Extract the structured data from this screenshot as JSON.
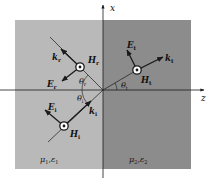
{
  "diagram": {
    "colors": {
      "background": "#ffffff",
      "medium1": "#b9b9b9",
      "medium2": "#8c8c8c",
      "lines": "#1a1a1a",
      "marker_fill": "#ffffff"
    },
    "axes": {
      "x": {
        "label": "x"
      },
      "z": {
        "label": "z"
      }
    },
    "media": [
      {
        "id": "medium1",
        "label_mu": "μ",
        "label_mu_sub": "1",
        "sep": ",",
        "label_eps": "ε",
        "label_eps_sub": "1"
      },
      {
        "id": "medium2",
        "label_mu": "μ",
        "label_mu_sub": "2",
        "sep": ",",
        "label_eps": "ε",
        "label_eps_sub": "2"
      }
    ],
    "waves": {
      "incident": {
        "k": {
          "sym": "k",
          "sub": "i"
        },
        "E": {
          "sym": "E",
          "sub": "i"
        },
        "H": {
          "sym": "H",
          "sub": "i"
        },
        "angle": {
          "sym": "θ",
          "sub": "i"
        }
      },
      "reflected": {
        "k": {
          "sym": "k",
          "sub": "r"
        },
        "E": {
          "sym": "E",
          "sub": "r"
        },
        "H": {
          "sym": "H",
          "sub": "r"
        },
        "angle": {
          "sym": "θ",
          "sub": "r"
        }
      },
      "transmitted": {
        "k": {
          "sym": "k",
          "sub": "t"
        },
        "E": {
          "sym": "E",
          "sub": "t"
        },
        "H": {
          "sym": "H",
          "sub": "t"
        },
        "angle": {
          "sym": "θ",
          "sub": "t"
        }
      }
    }
  }
}
